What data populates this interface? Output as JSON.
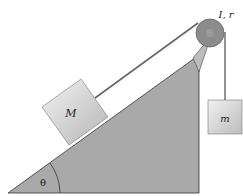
{
  "diagram": {
    "labels": {
      "incline_mass": "M",
      "hanging_mass": "m",
      "pulley": "I, r",
      "angle": "θ"
    },
    "colors": {
      "incline": "#a9a9a9",
      "pulley_rim": "#8a8a8a",
      "pulley_hub": "#6e6e6e",
      "block_light": "#eeeeee",
      "block_dark": "#b8b8b8",
      "rope": "#555555",
      "outline": "#333333"
    }
  }
}
